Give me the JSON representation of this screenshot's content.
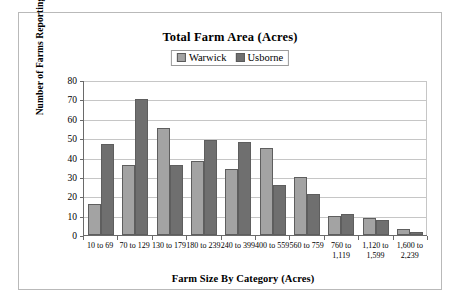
{
  "frame": {
    "name": "chart-border"
  },
  "chart_data": {
    "type": "bar",
    "title": "Total Farm Area (Acres)",
    "xlabel": "Farm Size By Category (Acres)",
    "ylabel": "Number of Farms Reporting",
    "ylim": [
      0,
      80
    ],
    "yticks": [
      0,
      10,
      20,
      30,
      40,
      50,
      60,
      70,
      80
    ],
    "ytick_labels": [
      "0",
      "10",
      "20",
      "30",
      "40",
      "50",
      "60",
      "70",
      "80"
    ],
    "grid": true,
    "legend_position": "top-center",
    "categories": [
      "10 to 69",
      "70 to 129",
      "130 to 179",
      "180 to 239",
      "240 to 399",
      "400 to 559",
      "560 to 759",
      "760 to\n1,119",
      "1,120 to\n1,599",
      "1,600 to\n2,239"
    ],
    "series": [
      {
        "name": "Warwick",
        "color": "#a3a3a3",
        "values": [
          16,
          36,
          55,
          38,
          34,
          45,
          30,
          10,
          9,
          3
        ]
      },
      {
        "name": "Usborne",
        "color": "#6f6f6f",
        "values": [
          47,
          70,
          36,
          49,
          48,
          26,
          21,
          11,
          8,
          1.5
        ]
      }
    ]
  }
}
